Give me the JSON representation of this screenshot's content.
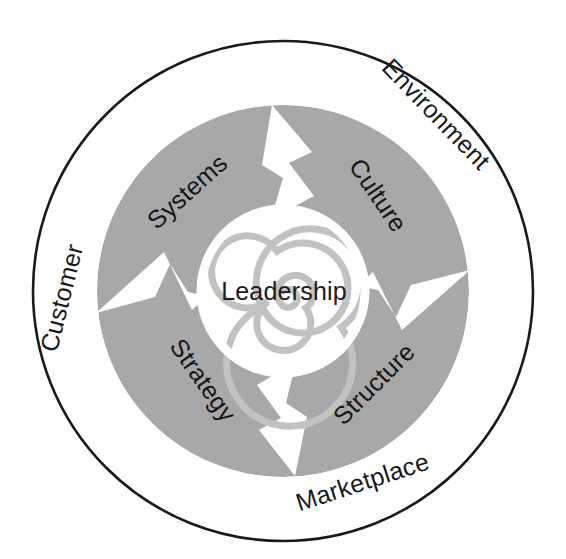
{
  "diagram": {
    "type": "concentric-circle-diagram",
    "center_label": "Leadership",
    "outer_ring_labels": [
      {
        "id": "customer",
        "text": "Customer"
      },
      {
        "id": "environment",
        "text": "Environment"
      },
      {
        "id": "marketplace",
        "text": "Marketplace"
      }
    ],
    "inner_sector_labels": [
      {
        "id": "systems",
        "text": "Systems"
      },
      {
        "id": "culture",
        "text": "Culture"
      },
      {
        "id": "strategy",
        "text": "Strategy"
      },
      {
        "id": "structure",
        "text": "Structure"
      }
    ],
    "colors": {
      "background": "#ffffff",
      "outer_stroke": "#1a1a1a",
      "gray_disc": "#a8a8a8",
      "spiral": "#bdbdbd",
      "text": "#1b1b1b"
    },
    "geometry": {
      "center_x": 283,
      "center_y": 291,
      "outer_radius": 250,
      "gray_radius": 186,
      "inner_white_radius": 82
    }
  }
}
